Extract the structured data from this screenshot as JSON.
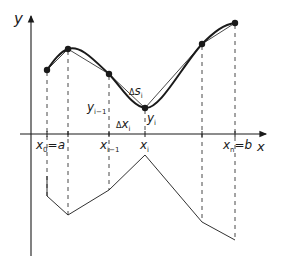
{
  "diagram": {
    "axes": {
      "y_label": "y",
      "x_label": "x"
    },
    "x_ticks": [
      {
        "id": "x0",
        "label": "x",
        "sub": "0",
        "suffix": "=a",
        "x": 47
      },
      {
        "id": "x1",
        "label": "",
        "sub": "",
        "suffix": "",
        "x": 68
      },
      {
        "id": "xim1",
        "label": "x",
        "sub": "i−1",
        "suffix": "",
        "x": 109
      },
      {
        "id": "xi",
        "label": "x",
        "sub": "i",
        "suffix": "",
        "x": 145
      },
      {
        "id": "xk",
        "label": "",
        "sub": "",
        "suffix": "",
        "x": 202
      },
      {
        "id": "xn",
        "label": "x",
        "sub": "n",
        "suffix": "=b",
        "x": 235
      }
    ],
    "curve_points": [
      {
        "x": 47,
        "y": 70
      },
      {
        "x": 68,
        "y": 49
      },
      {
        "x": 109,
        "y": 74
      },
      {
        "x": 145,
        "y": 108
      },
      {
        "x": 202,
        "y": 44
      },
      {
        "x": 235,
        "y": 23
      }
    ],
    "lower_polyline": [
      {
        "x": 47,
        "y": 196
      },
      {
        "x": 68,
        "y": 215
      },
      {
        "x": 109,
        "y": 190
      },
      {
        "x": 145,
        "y": 155
      },
      {
        "x": 202,
        "y": 222
      },
      {
        "x": 235,
        "y": 240
      }
    ],
    "annotations": {
      "delta_s": {
        "prefix": "Δ",
        "main": "s",
        "sub": "i"
      },
      "delta_x": {
        "prefix": "Δ",
        "main": "x",
        "sub": "i"
      },
      "y_im1": {
        "main": "y",
        "sub": "i−1"
      },
      "y_i": {
        "main": "y",
        "sub": "i"
      }
    },
    "colors": {
      "ink": "#1a1a1a",
      "background": "#ffffff"
    }
  }
}
